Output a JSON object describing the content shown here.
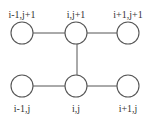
{
  "diagram": {
    "type": "grid-stencil",
    "colors": {
      "stroke": "#555555",
      "node_fill": "#ffffff",
      "label": "#333333",
      "background": "#ffffff"
    },
    "node_radius": 11,
    "nodes": [
      {
        "id": "tl",
        "label": "i-1,j+1",
        "cx": 22,
        "cy": 33,
        "label_x": 22,
        "label_y": 18
      },
      {
        "id": "tm",
        "label": "i,j+1",
        "cx": 76,
        "cy": 33,
        "label_x": 76,
        "label_y": 18
      },
      {
        "id": "tr",
        "label": "i+1,j+1",
        "cx": 128,
        "cy": 33,
        "label_x": 128,
        "label_y": 18
      },
      {
        "id": "bl",
        "label": "i-1,j",
        "cx": 22,
        "cy": 86,
        "label_x": 22,
        "label_y": 112
      },
      {
        "id": "bm",
        "label": "i,j",
        "cx": 76,
        "cy": 86,
        "label_x": 76,
        "label_y": 112
      },
      {
        "id": "br",
        "label": "i+1,j",
        "cx": 128,
        "cy": 86,
        "label_x": 128,
        "label_y": 112
      }
    ],
    "edges": [
      {
        "from": "tl",
        "to": "tm",
        "x1": 33,
        "y1": 33,
        "x2": 65,
        "y2": 33
      },
      {
        "from": "tm",
        "to": "tr",
        "x1": 87,
        "y1": 33,
        "x2": 117,
        "y2": 33
      },
      {
        "from": "tm",
        "to": "bm",
        "x1": 77,
        "y1": 44,
        "x2": 77,
        "y2": 75
      },
      {
        "from": "bl",
        "to": "bm",
        "x1": 33,
        "y1": 86,
        "x2": 65,
        "y2": 86
      },
      {
        "from": "bm",
        "to": "br",
        "x1": 87,
        "y1": 86,
        "x2": 117,
        "y2": 86
      }
    ]
  }
}
